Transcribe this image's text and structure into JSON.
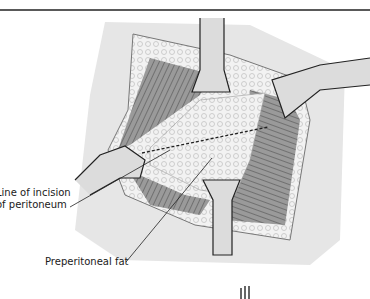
{
  "figure": {
    "labels": {
      "line_of_incision_line1": "Line of incision",
      "line_of_incision_line2": "of peritoneum",
      "preperitoneal_fat": "Preperitoneal fat"
    },
    "colors": {
      "skin": "#e8e8e8",
      "fat": "#f4f4f4",
      "muscle": "#8c8c8c",
      "retractor": "#d6d6d6",
      "outline": "#2a2a2a"
    }
  }
}
